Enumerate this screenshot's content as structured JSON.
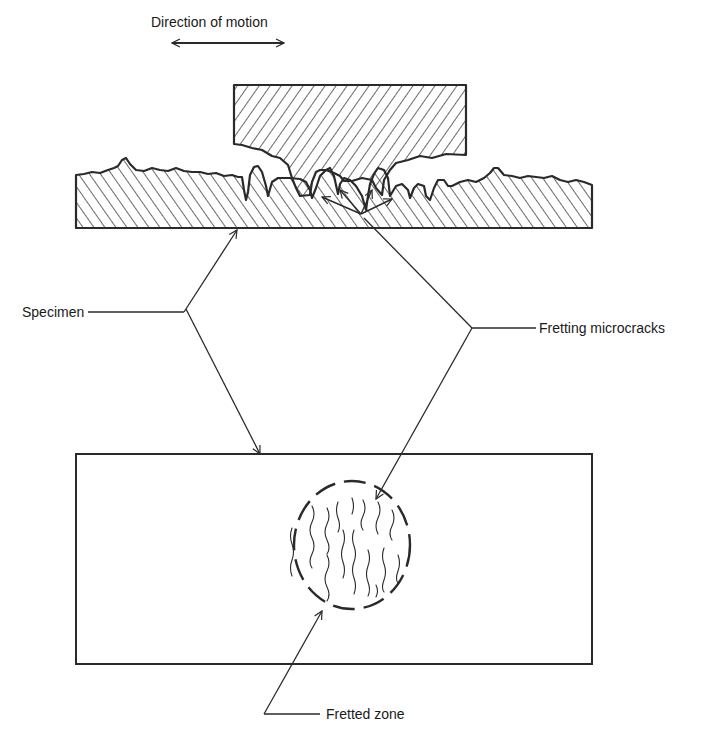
{
  "figure": {
    "type": "engineering cross-section diagram"
  },
  "labels": {
    "direction": "Direction of motion",
    "specimen": "Specimen",
    "fretting_microcracks": "Fretting microcracks",
    "fretted_zone": "Fretted zone"
  },
  "parts": {
    "upper_block": "Contact pad (hatched, cross-section)",
    "lower_block": "Specimen (hatched, cross-section)",
    "plan_view": "Specimen surface in plan view",
    "fretted_zone_outline": "Dashed circle containing wavy crack lines"
  },
  "colors": {
    "ink": "#2a2a2a",
    "background": "#ffffff"
  }
}
